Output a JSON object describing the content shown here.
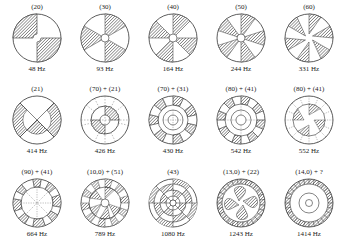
{
  "figure": {
    "rows": [
      [
        {
          "mode": "(20)",
          "freq": "48 Hz",
          "diam": 2,
          "circ": 0
        },
        {
          "mode": "(30)",
          "freq": "93 Hz",
          "diam": 3,
          "circ": 0
        },
        {
          "mode": "(40)",
          "freq": "164 Hz",
          "diam": 4,
          "circ": 0
        },
        {
          "mode": "(50)",
          "freq": "244 Hz",
          "diam": 5,
          "circ": 0
        },
        {
          "mode": "(60)",
          "freq": "331 Hz",
          "diam": 6,
          "circ": 0
        }
      ],
      [
        {
          "mode": "(21)",
          "freq": "414 Hz",
          "diam": 2,
          "circ": 1
        },
        {
          "mode": "(70) + (21)",
          "freq": "426 Hz",
          "diam": 7,
          "circ": 1
        },
        {
          "mode": "(70) + (31)",
          "freq": "430 Hz",
          "diam": 7,
          "circ": 1
        },
        {
          "mode": "(80) + (41)",
          "freq": "542 Hz",
          "diam": 8,
          "circ": 1
        },
        {
          "mode": "(80) + (41)",
          "freq": "552 Hz",
          "diam": 8,
          "circ": 1
        }
      ],
      [
        {
          "mode": "(90) + (41)",
          "freq": "664 Hz",
          "diam": 9,
          "circ": 1
        },
        {
          "mode": "(10,0) + (51)",
          "freq": "789 Hz",
          "diam": 10,
          "circ": 1
        },
        {
          "mode": "(43)",
          "freq": "1080 Hz",
          "diam": 4,
          "circ": 3
        },
        {
          "mode": "(13,0) + (22)",
          "freq": "1243 Hz",
          "diam": 13,
          "circ": 2
        },
        {
          "mode": "(14,0) + ?",
          "freq": "1414 Hz",
          "diam": 14,
          "circ": 2
        }
      ]
    ],
    "colors": {
      "line": "#333333",
      "hatch": "#555555",
      "background": "#ffffff"
    }
  }
}
